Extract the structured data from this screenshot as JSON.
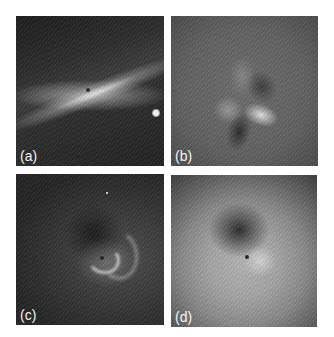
{
  "figure": {
    "panels": [
      {
        "id": "a",
        "label": "(a)",
        "description": "Edge-on disk: bright diagonal streak through dark center, bright point source at right edge"
      },
      {
        "id": "b",
        "label": "(b)",
        "description": "Noisy gray field with quadrupolar light/dark pattern around center"
      },
      {
        "id": "c",
        "label": "(c)",
        "description": "Dark field with bright curved spiral arcs near center"
      },
      {
        "id": "d",
        "label": "(d)",
        "description": "Bright ring-like halo with dark region upper-left of center"
      }
    ]
  }
}
